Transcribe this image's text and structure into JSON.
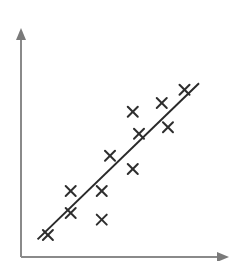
{
  "chart_data": {
    "type": "scatter",
    "title": "",
    "xlabel": "",
    "ylabel": "",
    "grid": false,
    "legend": null,
    "marker": "x",
    "note": "Unlabeled axes; values are relative positions (0-100) estimated from pixel locations. A linear regression (best-fit) line is drawn through the points.",
    "xlim": [
      0,
      100
    ],
    "ylim": [
      0,
      100
    ],
    "points": [
      {
        "x": 13,
        "y": 10
      },
      {
        "x": 24,
        "y": 20
      },
      {
        "x": 24,
        "y": 30
      },
      {
        "x": 39,
        "y": 17
      },
      {
        "x": 39,
        "y": 30
      },
      {
        "x": 43,
        "y": 46
      },
      {
        "x": 54,
        "y": 40
      },
      {
        "x": 54,
        "y": 66
      },
      {
        "x": 57,
        "y": 56
      },
      {
        "x": 68,
        "y": 70
      },
      {
        "x": 71,
        "y": 59
      },
      {
        "x": 79,
        "y": 76
      }
    ],
    "fit_line": {
      "x1": 8,
      "y1": 8,
      "x2": 86,
      "y2": 79
    },
    "colors": {
      "axis": "#8a8a8a",
      "marker": "#2e2e2e",
      "fit_line": "#2a2a2a",
      "background": "#ffffff"
    }
  },
  "plot_area": {
    "origin_px": [
      21,
      257
    ],
    "x_end_px": 227,
    "y_end_px": 30,
    "x_scale": 2.07,
    "y_scale": 2.2
  }
}
